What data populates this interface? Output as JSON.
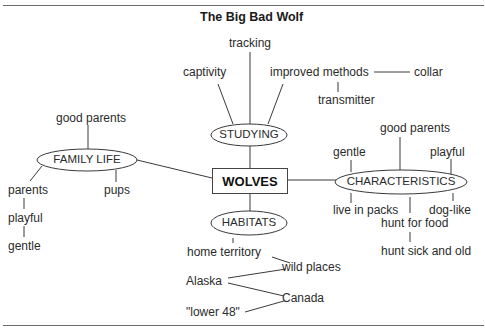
{
  "title": "The Big Bad Wolf",
  "center": {
    "label": "WOLVES"
  },
  "nodes": {
    "studying": {
      "label": "STUDYING",
      "children": {
        "tracking": "tracking",
        "captivity": "captivity",
        "improved_methods": "improved methods",
        "collar": "collar",
        "transmitter": "transmitter"
      }
    },
    "family_life": {
      "label": "FAMILY LIFE",
      "children": {
        "good_parents": "good parents",
        "parents": "parents",
        "pups": "pups",
        "playful": "playful",
        "gentle": "gentle"
      }
    },
    "characteristics": {
      "label": "CHARACTERISTICS",
      "children": {
        "good_parents": "good parents",
        "gentle": "gentle",
        "playful": "playful",
        "live_in_packs": "live in packs",
        "dog_like": "dog-like",
        "hunt_for_food": "hunt for food",
        "hunt_sick_and_old": "hunt sick and old"
      }
    },
    "habitats": {
      "label": "HABITATS",
      "children": {
        "home_territory": "home territory",
        "wild_places": "wild places",
        "alaska": "Alaska",
        "canada": "Canada",
        "lower_48": "\"lower 48\""
      }
    }
  },
  "colors": {
    "line": "#3a3a3a",
    "text": "#2b2b2b",
    "rule": "#6a6a6a"
  }
}
